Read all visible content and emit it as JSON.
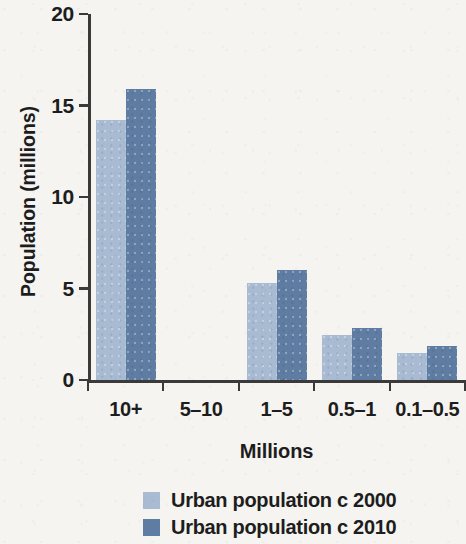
{
  "chart_data": {
    "type": "bar",
    "title": "",
    "subtitle": "",
    "xlabel": "Millions",
    "ylabel": "Population (millions)",
    "categories": [
      "10+",
      "5–10",
      "1–5",
      "0.5–1",
      "0.1–0.5"
    ],
    "series": [
      {
        "name": "Urban population c 2000",
        "color": "#a9bbd3",
        "values": [
          14.2,
          0,
          5.3,
          2.45,
          1.5
        ]
      },
      {
        "name": "Urban population c 2010",
        "color": "#5f7da3",
        "values": [
          15.9,
          0,
          6.0,
          2.85,
          1.85
        ]
      }
    ],
    "ylim": [
      0,
      20
    ],
    "yticks": [
      0,
      5,
      10,
      15,
      20
    ],
    "ytick_labels": [
      "0",
      "5",
      "10",
      "15",
      "20"
    ],
    "grid": false,
    "legend_position": "bottom-center"
  }
}
